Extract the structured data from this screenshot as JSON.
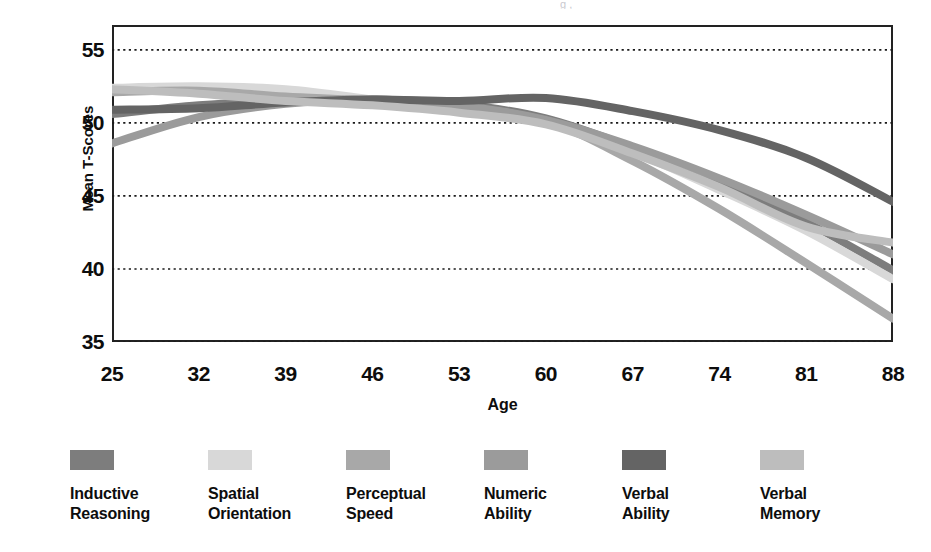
{
  "figure": {
    "scan_remnant": "g        ,"
  },
  "chart_data": {
    "type": "line",
    "title": "",
    "xlabel": "Age",
    "ylabel": "Mean T-Scores",
    "x": [
      25,
      32,
      39,
      46,
      53,
      60,
      67,
      74,
      81,
      88
    ],
    "xticklabels": [
      "25",
      "32",
      "39",
      "46",
      "53",
      "60",
      "67",
      "74",
      "81",
      "88"
    ],
    "yticklabels": [
      "55",
      "50",
      "45",
      "40",
      "35"
    ],
    "yticks": [
      55,
      50,
      45,
      40,
      35
    ],
    "xlim": [
      25,
      88
    ],
    "ylim": [
      35,
      56.7
    ],
    "grid": "horizontal-dotted",
    "legend_position": "below",
    "series": [
      {
        "name": "Inductive Reasoning",
        "color": "#7d7d7d",
        "values": [
          50.6,
          51.2,
          51.5,
          51.6,
          51.3,
          50.3,
          48.3,
          46.0,
          43.2,
          39.9
        ]
      },
      {
        "name": "Spatial Orientation",
        "color": "#d8d8d8",
        "values": [
          52.4,
          52.5,
          52.3,
          51.6,
          50.8,
          50.0,
          48.0,
          45.4,
          42.6,
          39.3
        ]
      },
      {
        "name": "Perceptual Speed",
        "color": "#a8a8a8",
        "values": [
          52.1,
          52.2,
          51.8,
          51.5,
          50.9,
          50.1,
          47.4,
          44.1,
          40.4,
          36.6
        ]
      },
      {
        "name": "Numeric Ability",
        "color": "#9b9b9b",
        "values": [
          48.6,
          50.4,
          51.3,
          51.6,
          51.2,
          50.2,
          48.4,
          46.2,
          43.7,
          41.0
        ]
      },
      {
        "name": "Verbal Ability",
        "color": "#646464",
        "values": [
          50.9,
          51.0,
          51.4,
          51.6,
          51.5,
          51.7,
          50.8,
          49.5,
          47.6,
          44.6
        ]
      },
      {
        "name": "Verbal Memory",
        "color": "#bdbdbd",
        "values": [
          52.3,
          52.0,
          51.5,
          51.2,
          50.7,
          49.9,
          47.9,
          45.6,
          42.9,
          41.8
        ]
      }
    ]
  },
  "legend": [
    {
      "label_line1": "Inductive",
      "label_line2": "Reasoning",
      "color": "#7d7d7d"
    },
    {
      "label_line1": "Spatial",
      "label_line2": "Orientation",
      "color": "#d8d8d8"
    },
    {
      "label_line1": "Perceptual",
      "label_line2": "Speed",
      "color": "#a8a8a8"
    },
    {
      "label_line1": "Numeric",
      "label_line2": "Ability",
      "color": "#9b9b9b"
    },
    {
      "label_line1": "Verbal",
      "label_line2": "Ability",
      "color": "#646464"
    },
    {
      "label_line1": "Verbal",
      "label_line2": "Memory",
      "color": "#bdbdbd"
    }
  ]
}
